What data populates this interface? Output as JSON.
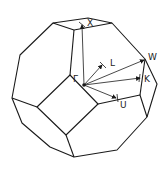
{
  "diagram": {
    "title": "",
    "labels": {
      "gamma": "Γ",
      "x": "X",
      "l": "L",
      "w": "W",
      "k": "K",
      "u": "U"
    },
    "line_color": "#1a1a1a",
    "background": "#ffffff"
  }
}
